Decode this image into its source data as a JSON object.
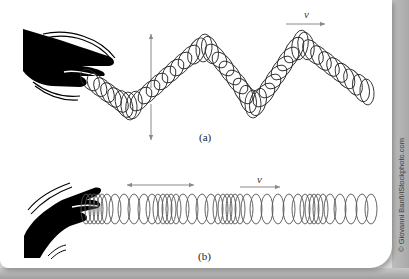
{
  "figure": {
    "panel_a": {
      "label": "(a)",
      "wave_type": "transverse",
      "velocity_label": "v",
      "displacement_arrow": "vertical double-headed"
    },
    "panel_b": {
      "label": "(b)",
      "wave_type": "longitudinal",
      "velocity_label": "v",
      "displacement_arrow": "horizontal double-headed"
    },
    "credit": "© Giovanni Banfi/iStockphoto.com",
    "colors": {
      "coil": "#2a2a2a",
      "coil_b": "#555555",
      "arrow": "#8a8a8a",
      "hand": "#000000",
      "background": "#ffffff"
    }
  }
}
